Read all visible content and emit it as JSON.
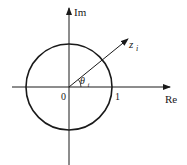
{
  "diagram": {
    "type": "complex-plane-unit-circle",
    "axes": {
      "x_label": "Re",
      "y_label": "Im"
    },
    "ticks": {
      "origin": "0",
      "unit": "1"
    },
    "vector": {
      "label_main": "z",
      "label_sub": "i"
    },
    "angle": {
      "label_main": "θ",
      "label_sub": "i"
    },
    "colors": {
      "stroke": "#1a1a1a",
      "background": "#ffffff"
    }
  }
}
